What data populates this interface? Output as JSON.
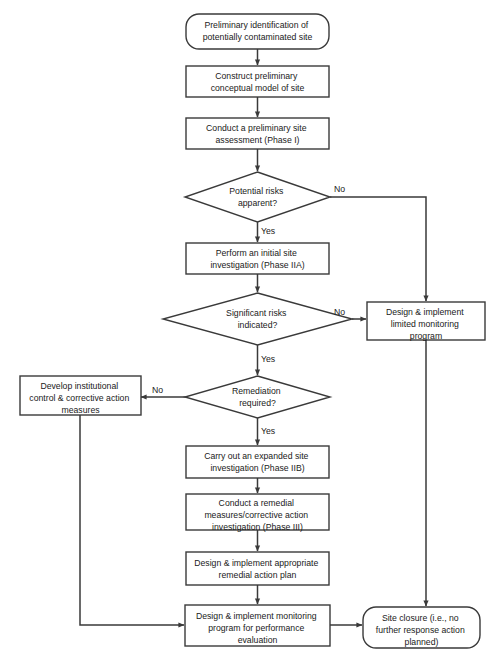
{
  "diagram": {
    "background_color": "#ffffff",
    "line_color": "#3a3a3a",
    "text_color": "#1a1a1a"
  },
  "nodes": [
    {
      "id": "start",
      "shape": "terminator",
      "lines": [
        "Preliminary identification of",
        "potentially contaminated site"
      ]
    },
    {
      "id": "conceptual-model",
      "shape": "process",
      "lines": [
        "Construct preliminary",
        "conceptual model of site"
      ]
    },
    {
      "id": "phase-1",
      "shape": "process",
      "lines": [
        "Conduct a preliminary site",
        "assessment (Phase I)"
      ]
    },
    {
      "id": "potential-risks",
      "shape": "decision",
      "lines": [
        "Potential risks",
        "apparent?"
      ]
    },
    {
      "id": "phase-2a",
      "shape": "process",
      "lines": [
        "Perform an initial site",
        "investigation (Phase IIA)"
      ]
    },
    {
      "id": "significant-risks",
      "shape": "decision",
      "lines": [
        "Significant risks",
        "indicated?"
      ]
    },
    {
      "id": "limited-monitoring",
      "shape": "process",
      "lines": [
        "Design & implement",
        "limited monitoring",
        "program"
      ]
    },
    {
      "id": "remediation-required",
      "shape": "decision",
      "lines": [
        "Remediation",
        "required?"
      ]
    },
    {
      "id": "institutional-control",
      "shape": "process",
      "lines": [
        "Develop institutional",
        "control & corrective action",
        "measures"
      ]
    },
    {
      "id": "phase-2b",
      "shape": "process",
      "lines": [
        "Carry out an expanded site",
        "investigation (Phase IIB)"
      ]
    },
    {
      "id": "phase-3",
      "shape": "process",
      "lines": [
        "Conduct a remedial",
        "measures/corrective action",
        "investigation (Phase III)"
      ]
    },
    {
      "id": "remedial-action-plan",
      "shape": "process",
      "lines": [
        "Design & implement appropriate",
        "remedial action plan"
      ]
    },
    {
      "id": "performance-monitoring",
      "shape": "process",
      "lines": [
        "Design & implement monitoring",
        "program for performance",
        "evaluation"
      ]
    },
    {
      "id": "site-closure",
      "shape": "terminator",
      "lines": [
        "Site closure (i.e., no",
        "further response action",
        "planned)"
      ]
    }
  ],
  "edge_labels": {
    "potential_risks_no": "No",
    "potential_risks_yes": "Yes",
    "significant_risks_no": "No",
    "significant_risks_yes": "Yes",
    "remediation_no": "No",
    "remediation_yes": "Yes"
  }
}
